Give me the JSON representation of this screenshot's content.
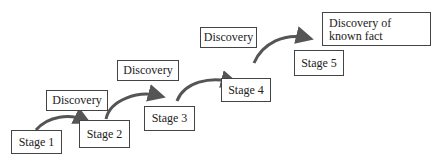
{
  "diagram": {
    "stages": [
      {
        "label": "Stage 1",
        "x": 11,
        "y": 130,
        "w": 51,
        "h": 24
      },
      {
        "label": "Stage 2",
        "x": 79,
        "y": 120,
        "w": 51,
        "h": 28
      },
      {
        "label": "Stage 3",
        "x": 144,
        "y": 106,
        "w": 51,
        "h": 25
      },
      {
        "label": "Stage 4",
        "x": 221,
        "y": 78,
        "w": 50,
        "h": 24
      },
      {
        "label": "Stage 5",
        "x": 294,
        "y": 50,
        "w": 50,
        "h": 26
      }
    ],
    "transitions": [
      {
        "label": "Discovery",
        "x": 46,
        "y": 90,
        "w": 62,
        "h": 21
      },
      {
        "label": "Discovery",
        "x": 117,
        "y": 60,
        "w": 62,
        "h": 21
      },
      {
        "label": "Discovery",
        "x": 200,
        "y": 27,
        "w": 57,
        "h": 21
      },
      {
        "label": "Discovery of known fact",
        "x": 322,
        "y": 12,
        "w": 109,
        "h": 34
      }
    ],
    "arrow_color": "#555555"
  }
}
